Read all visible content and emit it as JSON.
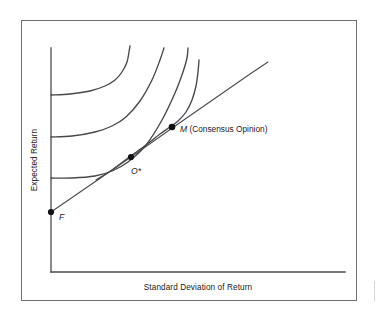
{
  "figure": {
    "frame_color": "#6f6f74",
    "ink_color": "#47474c",
    "background": "#ffffff"
  },
  "chart_data": {
    "type": "line",
    "title": "",
    "subtitle": "",
    "xlabel": "Standard Deviation of Return",
    "ylabel": "Expected Return",
    "grid": false,
    "legend_position": "none",
    "axis_ticks": {
      "x": [],
      "y": []
    },
    "xlim": [
      0,
      1
    ],
    "ylim": [
      0,
      1
    ],
    "series": [
      {
        "name": "Indifference Curve 3 (highest utility)",
        "kind": "indifference-curve",
        "points_px": [
          [
            51,
            95
          ],
          [
            70,
            94
          ],
          [
            90,
            91
          ],
          [
            105,
            86
          ],
          [
            115,
            80
          ],
          [
            122,
            72
          ],
          [
            127,
            62
          ],
          [
            129,
            52
          ],
          [
            130,
            46
          ]
        ]
      },
      {
        "name": "Indifference Curve 2",
        "kind": "indifference-curve",
        "points_px": [
          [
            51,
            137
          ],
          [
            72,
            136
          ],
          [
            95,
            132
          ],
          [
            112,
            126
          ],
          [
            126,
            117
          ],
          [
            140,
            101
          ],
          [
            152,
            80
          ],
          [
            160,
            60
          ],
          [
            164,
            48
          ]
        ]
      },
      {
        "name": "Indifference Curve 1 (tangent at O*)",
        "kind": "indifference-curve",
        "points_px": [
          [
            51,
            178
          ],
          [
            72,
            178
          ],
          [
            95,
            176
          ],
          [
            112,
            171
          ],
          [
            128,
            162
          ],
          [
            146,
            145
          ],
          [
            162,
            120
          ],
          [
            175,
            93
          ],
          [
            183,
            72
          ],
          [
            187,
            58
          ],
          [
            188,
            48
          ]
        ]
      },
      {
        "name": "Efficient Frontier",
        "kind": "frontier-curve",
        "points_px": [
          [
            96,
            180
          ],
          [
            112,
            170
          ],
          [
            128,
            158
          ],
          [
            146,
            145
          ],
          [
            160,
            134
          ],
          [
            170,
            127
          ],
          [
            178,
            121
          ],
          [
            186,
            112
          ],
          [
            192,
            100
          ],
          [
            196,
            86
          ],
          [
            198,
            72
          ],
          [
            199,
            60
          ]
        ]
      },
      {
        "name": "Capital Market Line",
        "kind": "straight-line",
        "points_px": [
          [
            51,
            212
          ],
          [
            131,
            157
          ],
          [
            178,
            124
          ],
          [
            250,
            74
          ],
          [
            268,
            62
          ]
        ]
      }
    ],
    "annotations": [
      {
        "id": "point-F",
        "label": "F",
        "italic": true,
        "point_px": [
          51,
          212
        ],
        "label_px": [
          59,
          220
        ],
        "meaning": "Risk-free rate intercept"
      },
      {
        "id": "point-O-star",
        "label": "O*",
        "italic": true,
        "point_px": [
          131,
          157
        ],
        "label_px": [
          131,
          174
        ],
        "meaning": "Optimal portfolio on Capital Market Line"
      },
      {
        "id": "point-M",
        "label_italic": "M",
        "label_roman": " (Consensus Opinion)",
        "point_px": [
          172,
          127
        ],
        "label_px": [
          180,
          132
        ],
        "meaning": "Market portfolio / tangency point"
      }
    ],
    "axis_lines": {
      "y_axis_px": [
        [
          51,
          48
        ],
        [
          51,
          272
        ]
      ],
      "x_axis_px": [
        [
          51,
          272
        ],
        [
          345,
          272
        ]
      ]
    }
  },
  "labels": {
    "y_axis_title": "Expected Return",
    "x_axis_title": "Standard Deviation of Return",
    "point_f": "F",
    "point_o_star": "O*",
    "point_m_symbol": "M",
    "point_m_text": " (Consensus Opinion)"
  }
}
